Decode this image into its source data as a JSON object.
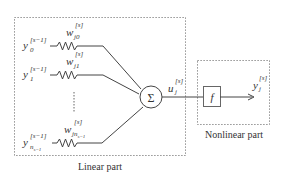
{
  "diagram": {
    "inputs": [
      {
        "y_base": "y",
        "y_sub": "0",
        "y_sup": "[s−1]",
        "w_base": "w",
        "w_sub": "j0",
        "w_sup": "[s]"
      },
      {
        "y_base": "y",
        "y_sub": "1",
        "y_sup": "[s−1]",
        "w_base": "w",
        "w_sub": "j1",
        "w_sup": "[s]"
      },
      {
        "y_base": "y",
        "y_sub": "n",
        "y_sub2": "s−1",
        "y_sup": "[s−1]",
        "w_base": "w",
        "w_sub": "jn",
        "w_sub2": "s−1",
        "w_sup": "[s]"
      }
    ],
    "sum_symbol": "Σ",
    "u_label": {
      "base": "u",
      "sub": "j",
      "sup": "[s]"
    },
    "f_symbol": "f",
    "output_label": {
      "base": "y",
      "sub": "j",
      "sup": "[s]"
    },
    "linear_part_label": "Linear part",
    "nonlinear_part_label": "Nonlinear part",
    "colors": {
      "stroke": "#444444",
      "dotted": "#777777",
      "text": "#333333"
    }
  }
}
